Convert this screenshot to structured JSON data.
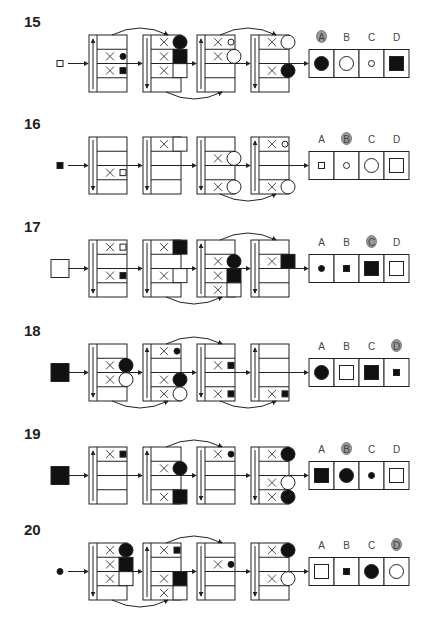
{
  "page": {
    "colors": {
      "ink": "#222222",
      "fill_black": "#111111",
      "answer_badge": "#9a9a9a",
      "background": "#ffffff"
    }
  },
  "layout": {
    "box_x": [
      89,
      143,
      197,
      251
    ],
    "box_w": 38,
    "row_h": 14.25,
    "strip_w": 8,
    "panel_x": 309,
    "cell_w": 25,
    "cell_h": 28
  },
  "puzzles": [
    {
      "number": "15",
      "top": 35,
      "input": {
        "shape": "square",
        "size": "small",
        "fill": "white"
      },
      "answer": "A",
      "boxes": [
        {
          "dir": "up",
          "rows": [
            null,
            {
              "shape": "circle",
              "size": "small",
              "fill": "black"
            },
            {
              "shape": "square",
              "size": "small",
              "fill": "black"
            },
            null
          ]
        },
        {
          "dir": "down",
          "rows": [
            {
              "shape": "circle",
              "size": "large",
              "fill": "black"
            },
            {
              "shape": "square",
              "size": "large",
              "fill": "black"
            },
            {
              "shape": "square",
              "size": "large",
              "fill": "white"
            },
            null
          ]
        },
        {
          "dir": "up",
          "rows": [
            {
              "shape": "circle",
              "size": "small",
              "fill": "white"
            },
            {
              "shape": "circle",
              "size": "large",
              "fill": "white"
            },
            null,
            null
          ]
        },
        {
          "dir": "down",
          "rows": [
            {
              "shape": "circle",
              "size": "large",
              "fill": "white"
            },
            null,
            {
              "shape": "circle",
              "size": "large",
              "fill": "black"
            },
            null
          ]
        }
      ],
      "arcs": [
        {
          "from": 0,
          "to": 1,
          "side": "top"
        },
        {
          "from": 1,
          "to": 2,
          "side": "bottom"
        },
        {
          "from": 2,
          "to": 3,
          "side": "top"
        }
      ],
      "options": [
        {
          "label": "A",
          "shape": "circle",
          "size": "large",
          "fill": "black"
        },
        {
          "label": "B",
          "shape": "circle",
          "size": "large",
          "fill": "white"
        },
        {
          "label": "C",
          "shape": "circle",
          "size": "small",
          "fill": "white"
        },
        {
          "label": "D",
          "shape": "square",
          "size": "large",
          "fill": "black"
        }
      ]
    },
    {
      "number": "16",
      "top": 137,
      "input": {
        "shape": "square",
        "size": "small",
        "fill": "black"
      },
      "answer": "B",
      "boxes": [
        {
          "dir": "down",
          "rows": [
            null,
            null,
            {
              "shape": "square",
              "size": "small",
              "fill": "white"
            },
            null
          ]
        },
        {
          "dir": "down",
          "rows": [
            {
              "shape": "square",
              "size": "large",
              "fill": "white"
            },
            null,
            null,
            null
          ]
        },
        {
          "dir": "down",
          "rows": [
            null,
            {
              "shape": "circle",
              "size": "large",
              "fill": "white"
            },
            null,
            {
              "shape": "circle",
              "size": "large",
              "fill": "white"
            }
          ]
        },
        {
          "dir": "up",
          "rows": [
            {
              "shape": "circle",
              "size": "small",
              "fill": "white"
            },
            null,
            null,
            {
              "shape": "circle",
              "size": "large",
              "fill": "white"
            }
          ]
        }
      ],
      "arcs": [
        {
          "from": 2,
          "to": 3,
          "side": "bottom"
        }
      ],
      "options": [
        {
          "label": "A",
          "shape": "square",
          "size": "small",
          "fill": "white"
        },
        {
          "label": "B",
          "shape": "circle",
          "size": "small",
          "fill": "white"
        },
        {
          "label": "C",
          "shape": "circle",
          "size": "large",
          "fill": "white"
        },
        {
          "label": "D",
          "shape": "square",
          "size": "large",
          "fill": "white"
        }
      ]
    },
    {
      "number": "17",
      "top": 240,
      "input": {
        "shape": "square",
        "size": "xlarge",
        "fill": "white"
      },
      "answer": "C",
      "boxes": [
        {
          "dir": "down",
          "rows": [
            {
              "shape": "square",
              "size": "small",
              "fill": "white"
            },
            null,
            {
              "shape": "square",
              "size": "small",
              "fill": "black"
            },
            null
          ]
        },
        {
          "dir": "down",
          "rows": [
            {
              "shape": "square",
              "size": "large",
              "fill": "black"
            },
            null,
            {
              "shape": "square",
              "size": "large",
              "fill": "white"
            },
            null
          ]
        },
        {
          "dir": "up",
          "rows": [
            null,
            {
              "shape": "circle",
              "size": "large",
              "fill": "black"
            },
            {
              "shape": "square",
              "size": "large",
              "fill": "black"
            },
            {
              "shape": "square",
              "size": "large",
              "fill": "white"
            }
          ]
        },
        {
          "dir": "down",
          "rows": [
            null,
            {
              "shape": "square",
              "size": "large",
              "fill": "black"
            },
            null,
            null
          ]
        }
      ],
      "arcs": [
        {
          "from": 1,
          "to": 2,
          "side": "bottom"
        },
        {
          "from": 2,
          "to": 3,
          "side": "top"
        }
      ],
      "options": [
        {
          "label": "A",
          "shape": "circle",
          "size": "small",
          "fill": "black"
        },
        {
          "label": "B",
          "shape": "square",
          "size": "small",
          "fill": "black"
        },
        {
          "label": "C",
          "shape": "square",
          "size": "large",
          "fill": "black"
        },
        {
          "label": "D",
          "shape": "square",
          "size": "large",
          "fill": "white"
        }
      ]
    },
    {
      "number": "18",
      "top": 344,
      "input": {
        "shape": "square",
        "size": "xlarge",
        "fill": "black"
      },
      "answer": "D",
      "boxes": [
        {
          "dir": "down",
          "rows": [
            null,
            {
              "shape": "circle",
              "size": "large",
              "fill": "black"
            },
            {
              "shape": "circle",
              "size": "large",
              "fill": "white"
            },
            null
          ]
        },
        {
          "dir": "up",
          "rows": [
            {
              "shape": "circle",
              "size": "small",
              "fill": "black"
            },
            null,
            {
              "shape": "circle",
              "size": "large",
              "fill": "black"
            },
            {
              "shape": "circle",
              "size": "large",
              "fill": "white"
            }
          ]
        },
        {
          "dir": "down",
          "rows": [
            null,
            {
              "shape": "square",
              "size": "small",
              "fill": "black"
            },
            null,
            {
              "shape": "square",
              "size": "small",
              "fill": "black"
            }
          ]
        },
        {
          "dir": "up",
          "rows": [
            null,
            null,
            null,
            {
              "shape": "square",
              "size": "small",
              "fill": "black"
            }
          ]
        }
      ],
      "arcs": [
        {
          "from": 0,
          "to": 1,
          "side": "bottom"
        },
        {
          "from": 1,
          "to": 2,
          "side": "top"
        },
        {
          "from": 2,
          "to": 3,
          "side": "bottom"
        }
      ],
      "options": [
        {
          "label": "A",
          "shape": "circle",
          "size": "large",
          "fill": "black"
        },
        {
          "label": "B",
          "shape": "square",
          "size": "large",
          "fill": "white"
        },
        {
          "label": "C",
          "shape": "square",
          "size": "large",
          "fill": "black"
        },
        {
          "label": "D",
          "shape": "square",
          "size": "small",
          "fill": "black"
        }
      ]
    },
    {
      "number": "19",
      "top": 447,
      "input": {
        "shape": "square",
        "size": "xlarge",
        "fill": "black"
      },
      "answer": "B",
      "boxes": [
        {
          "dir": "up",
          "rows": [
            {
              "shape": "square",
              "size": "small",
              "fill": "black"
            },
            null,
            null,
            null
          ]
        },
        {
          "dir": "up",
          "rows": [
            null,
            {
              "shape": "circle",
              "size": "large",
              "fill": "black"
            },
            null,
            {
              "shape": "square",
              "size": "large",
              "fill": "black"
            }
          ]
        },
        {
          "dir": "down",
          "rows": [
            {
              "shape": "circle",
              "size": "small",
              "fill": "black"
            },
            null,
            null,
            null
          ]
        },
        {
          "dir": "down",
          "rows": [
            {
              "shape": "circle",
              "size": "large",
              "fill": "black"
            },
            null,
            {
              "shape": "circle",
              "size": "large",
              "fill": "white"
            },
            {
              "shape": "circle",
              "size": "large",
              "fill": "black"
            }
          ]
        }
      ],
      "arcs": [
        {
          "from": 1,
          "to": 2,
          "side": "top"
        }
      ],
      "options": [
        {
          "label": "A",
          "shape": "square",
          "size": "large",
          "fill": "black"
        },
        {
          "label": "B",
          "shape": "circle",
          "size": "large",
          "fill": "black"
        },
        {
          "label": "C",
          "shape": "circle",
          "size": "small",
          "fill": "black"
        },
        {
          "label": "D",
          "shape": "square",
          "size": "large",
          "fill": "white"
        }
      ]
    },
    {
      "number": "20",
      "top": 543,
      "input": {
        "shape": "circle",
        "size": "small",
        "fill": "black"
      },
      "answer": "D",
      "boxes": [
        {
          "dir": "down",
          "rows": [
            {
              "shape": "circle",
              "size": "large",
              "fill": "black"
            },
            {
              "shape": "square",
              "size": "large",
              "fill": "black"
            },
            {
              "shape": "square",
              "size": "large",
              "fill": "white"
            },
            null
          ]
        },
        {
          "dir": "up",
          "rows": [
            {
              "shape": "square",
              "size": "small",
              "fill": "black"
            },
            null,
            {
              "shape": "square",
              "size": "large",
              "fill": "black"
            },
            {
              "shape": "square",
              "size": "large",
              "fill": "white"
            }
          ]
        },
        {
          "dir": "down",
          "rows": [
            null,
            {
              "shape": "circle",
              "size": "small",
              "fill": "black"
            },
            null,
            null
          ]
        },
        {
          "dir": "down",
          "rows": [
            {
              "shape": "circle",
              "size": "large",
              "fill": "black"
            },
            null,
            {
              "shape": "circle",
              "size": "large",
              "fill": "white"
            },
            null
          ]
        }
      ],
      "arcs": [
        {
          "from": 0,
          "to": 1,
          "side": "bottom"
        },
        {
          "from": 1,
          "to": 2,
          "side": "top"
        }
      ],
      "options": [
        {
          "label": "A",
          "shape": "square",
          "size": "large",
          "fill": "white"
        },
        {
          "label": "B",
          "shape": "square",
          "size": "small",
          "fill": "black"
        },
        {
          "label": "C",
          "shape": "circle",
          "size": "large",
          "fill": "black"
        },
        {
          "label": "D",
          "shape": "circle",
          "size": "large",
          "fill": "white"
        }
      ]
    }
  ]
}
